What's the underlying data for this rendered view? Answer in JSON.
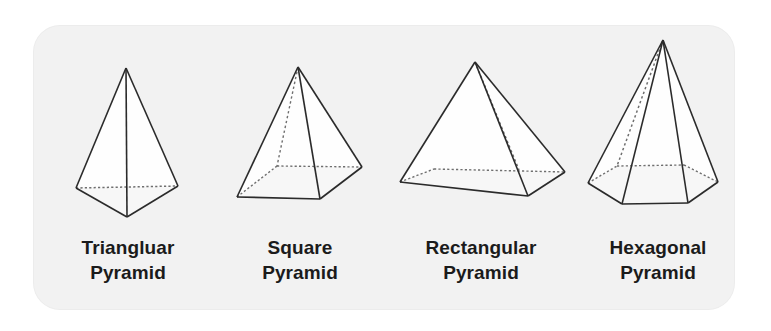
{
  "figure": {
    "card": {
      "background_color": "#f2f2f2",
      "border_radius_px": 26
    },
    "style": {
      "edge_color": "#2b2b2b",
      "hidden_edge_color": "#6f6f6f",
      "base_fill_color": "#9a9a9a",
      "base_fill_color_light": "#a8a8a8",
      "face_fill_color": "#ffffff",
      "label_color": "#1b1b1b"
    },
    "shapes": [
      {
        "id": "triangular-pyramid",
        "label_line1": "Triangluar",
        "label_line2": "Pyramid",
        "base_sides": 3,
        "base_shape": "triangle",
        "hidden_edges": "dotted-back-base-edge"
      },
      {
        "id": "square-pyramid",
        "label_line1": "Square",
        "label_line2": "Pyramid",
        "base_sides": 4,
        "base_shape": "square",
        "hidden_edges": "dotted-back-vertex-and-base-edges"
      },
      {
        "id": "rectangular-pyramid",
        "label_line1": "Rectangular",
        "label_line2": "Pyramid",
        "base_sides": 4,
        "base_shape": "rectangle",
        "hidden_edges": "dotted-back-vertex-and-base-edges"
      },
      {
        "id": "hexagonal-pyramid",
        "label_line1": "Hexagonal",
        "label_line2": "Pyramid",
        "base_sides": 6,
        "base_shape": "hexagon",
        "hidden_edges": "dotted-back-vertex-and-base-edges"
      }
    ]
  }
}
